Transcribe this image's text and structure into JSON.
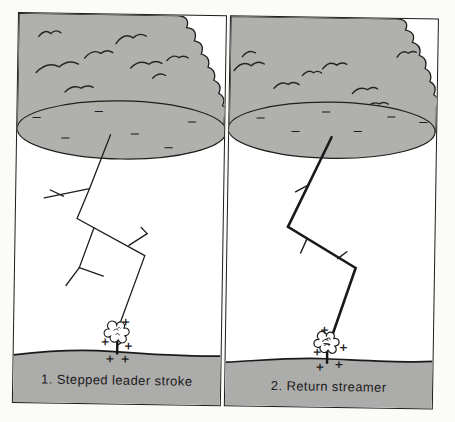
{
  "figure": {
    "charges": {
      "negative": "−",
      "positive": "+"
    },
    "panels": [
      {
        "caption": "1. Stepped leader stroke"
      },
      {
        "caption": "2. Return streamer"
      }
    ],
    "colors": {
      "cloud_gray": "#b0b0ad",
      "ground_gray": "#acacaa",
      "line_black": "#1e1e1e",
      "paper_white": "#fbfbf8"
    }
  }
}
